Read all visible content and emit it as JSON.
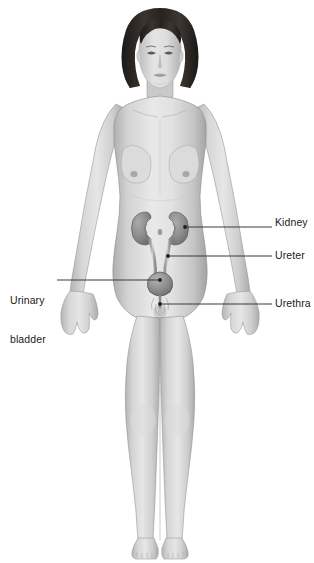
{
  "illustration": {
    "subject": "female-anterior-full-body",
    "system": "urinary system",
    "style": "grayscale medical illustration",
    "background_color": "#ffffff",
    "skin_tone": "#d9d9d9",
    "hair_color": "#2a2520",
    "organ_color": "#8f8f8f",
    "leader_line_color": "#3a3a3a",
    "label_color": "#1a1a1a"
  },
  "labels": {
    "kidney": "Kidney",
    "ureter": "Ureter",
    "urethra": "Urethra",
    "bladder_line1": "Urinary",
    "bladder_line2": "bladder"
  },
  "leaders": {
    "kidney": {
      "dot_x": 185,
      "dot_y": 227,
      "end_x": 272,
      "y": 227
    },
    "ureter": {
      "dot_x": 168,
      "dot_y": 256,
      "end_x": 272,
      "y": 256
    },
    "urethra": {
      "dot_x": 160,
      "dot_y": 304,
      "end_x": 272,
      "y": 304
    },
    "bladder": {
      "dot_x": 160,
      "dot_y": 280,
      "end_x": 57,
      "y": 280
    }
  }
}
